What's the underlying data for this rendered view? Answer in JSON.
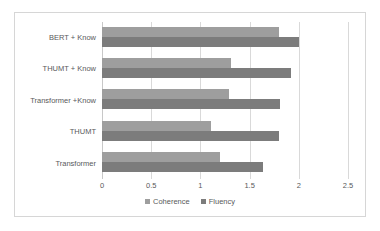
{
  "chart_data": {
    "type": "bar",
    "orientation": "horizontal",
    "title": "",
    "xlabel": "",
    "ylabel": "",
    "xlim": [
      0,
      2.5
    ],
    "xticks": [
      "0",
      "0.5",
      "1",
      "1.5",
      "2",
      "2.5"
    ],
    "xtick_values": [
      0,
      0.5,
      1,
      1.5,
      2,
      2.5
    ],
    "grid": true,
    "legend_position": "bottom",
    "categories": [
      "BERT + Know",
      "THUMT + Know",
      "Transformer +Know",
      "THUMT",
      "Transformer"
    ],
    "series": [
      {
        "name": "Coherence",
        "color": "#9e9e9e",
        "values": [
          1.8,
          1.31,
          1.29,
          1.11,
          1.2
        ]
      },
      {
        "name": "Fluency",
        "color": "#7c7c7c",
        "values": [
          2.0,
          1.92,
          1.81,
          1.8,
          1.64
        ]
      }
    ]
  },
  "colors": {
    "coherence": "#9e9e9e",
    "fluency": "#7c7c7c",
    "gridline": "#d9d9d9",
    "axis": "#c8c8c8",
    "frame": "#d6d6d6",
    "text": "#59595b",
    "background": "#ffffff"
  }
}
